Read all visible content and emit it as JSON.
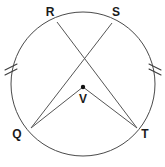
{
  "diagram": {
    "shape_type": "circle-with-chords",
    "background_color": "#ffffff",
    "stroke_color": "#4a4a4a",
    "label_color": "#1a1a1a",
    "circle": {
      "center_x": 83,
      "center_y": 84,
      "radius": 72
    },
    "points": {
      "R": {
        "label": "R",
        "x": 57,
        "y": 22,
        "label_x": 50,
        "label_y": 16
      },
      "S": {
        "label": "S",
        "x": 112,
        "y": 23,
        "label_x": 116,
        "label_y": 16
      },
      "Q": {
        "label": "Q",
        "x": 31,
        "y": 128,
        "label_x": 17,
        "label_y": 138
      },
      "T": {
        "label": "T",
        "x": 137,
        "y": 128,
        "label_x": 145,
        "label_y": 138
      },
      "V": {
        "label": "V",
        "x": 83,
        "y": 87,
        "label_x": 83,
        "label_y": 103
      }
    },
    "segments": [
      {
        "name": "chord-R-T",
        "from": "R",
        "to": "T"
      },
      {
        "name": "chord-S-Q",
        "from": "S",
        "to": "Q"
      },
      {
        "name": "radius-V-Q",
        "from": "V",
        "to": "Q"
      },
      {
        "name": "radius-V-T",
        "from": "V",
        "to": "T"
      }
    ],
    "intersection": {
      "x": 83,
      "y": 57
    },
    "tick_marks": [
      {
        "name": "arc-tick-left",
        "arc": "RQ",
        "x": 11,
        "y": 68,
        "count": 2
      },
      {
        "name": "arc-tick-right",
        "arc": "ST",
        "x": 155,
        "y": 68,
        "count": 2
      }
    ]
  }
}
